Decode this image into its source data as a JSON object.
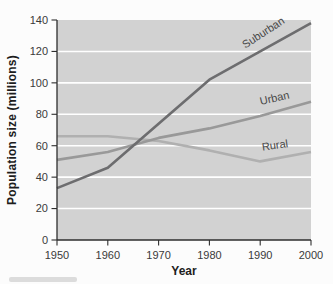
{
  "page": {
    "background": "#fcfcfc"
  },
  "chart_data": {
    "type": "line",
    "title": "",
    "xlabel": "Year",
    "ylabel": "Population size (millions)",
    "x": [
      1950,
      1960,
      1970,
      1980,
      1990,
      2000
    ],
    "x_ticks": [
      1950,
      1960,
      1970,
      1980,
      1990,
      2000
    ],
    "y_ticks": [
      0,
      20,
      40,
      60,
      80,
      100,
      120,
      140
    ],
    "xlim": [
      1950,
      2000
    ],
    "ylim": [
      0,
      140
    ],
    "grid": "horizontal gridlines only, white on gray plot background",
    "legend_position": "inline labels along lines",
    "plot_bg_color": "#d2d2d2",
    "gridline_color": "#ffffff",
    "axis_color": "#2e2e2e",
    "tick_label_color": "#3a3a3a",
    "series_label_color": "#484848",
    "series": [
      {
        "name": "Rural",
        "color": "#b0b0b0",
        "values": [
          66,
          66,
          63,
          57,
          50,
          56
        ],
        "label": {
          "year": 1993,
          "value": 58,
          "rotation_deg": -8
        }
      },
      {
        "name": "Urban",
        "color": "#999999",
        "values": [
          51,
          56,
          65,
          71,
          79,
          88
        ],
        "label": {
          "year": 1993,
          "value": 88,
          "rotation_deg": -13
        }
      },
      {
        "name": "Suburban",
        "color": "#6d6d6f",
        "values": [
          33,
          46,
          74,
          102,
          120,
          138
        ],
        "label": {
          "year": 1991,
          "value": 130,
          "rotation_deg": -33
        }
      }
    ]
  },
  "artifacts": {
    "bottom_left_smudge": "faint gray edge of cropped caption"
  }
}
